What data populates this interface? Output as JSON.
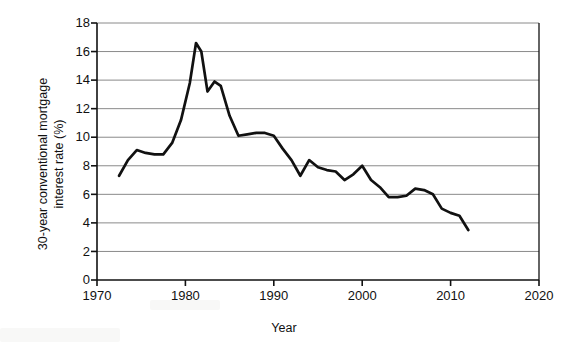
{
  "chart_data": {
    "type": "line",
    "title": "",
    "xlabel": "Year",
    "ylabel": "30-year conventional mortgage interest rate (%)",
    "ylabel_line1": "30-year conventional mortgage",
    "ylabel_line2": "interest rate (%)",
    "xlim": [
      1970,
      2020
    ],
    "ylim": [
      0,
      18
    ],
    "xticks": [
      1970,
      1980,
      1990,
      2000,
      2010,
      2020
    ],
    "xtick_labels": [
      "1970",
      "1980",
      "1990",
      "2000",
      "2010",
      "2020"
    ],
    "yticks": [
      0,
      2,
      4,
      6,
      8,
      10,
      12,
      14,
      16,
      18
    ],
    "ytick_labels": [
      "0",
      "2",
      "4",
      "6",
      "8",
      "10",
      "12",
      "14",
      "16",
      "18"
    ],
    "grid": "horizontal",
    "legend": "none",
    "line_color": "#111111",
    "grid_color": "#8a8a8a",
    "axis_color": "#111111",
    "series": [
      {
        "name": "30-year conventional mortgage interest rate",
        "x": [
          1972.5,
          1973.5,
          1974.5,
          1975.5,
          1976.5,
          1977.5,
          1978.5,
          1979.5,
          1980.5,
          1981.2,
          1981.8,
          1982.5,
          1983.3,
          1984.0,
          1985.0,
          1986.0,
          1987.0,
          1988.0,
          1989.0,
          1990.0,
          1991.0,
          1992.0,
          1993.0,
          1994.0,
          1995.0,
          1996.0,
          1997.0,
          1998.0,
          1999.0,
          2000.0,
          2001.0,
          2002.0,
          2003.0,
          2004.0,
          2005.0,
          2006.0,
          2007.0,
          2008.0,
          2009.0,
          2010.0,
          2011.0,
          2012.0
        ],
        "y": [
          7.3,
          8.4,
          9.1,
          8.9,
          8.8,
          8.8,
          9.6,
          11.2,
          13.8,
          16.6,
          16.0,
          13.2,
          13.9,
          13.6,
          11.5,
          10.1,
          10.2,
          10.3,
          10.3,
          10.1,
          9.2,
          8.4,
          7.3,
          8.4,
          7.9,
          7.7,
          7.6,
          7.0,
          7.4,
          8.0,
          7.0,
          6.5,
          5.8,
          5.8,
          5.9,
          6.4,
          6.3,
          6.0,
          5.0,
          4.7,
          4.5,
          3.5
        ]
      }
    ]
  },
  "axis": {
    "y_tick_0": "0",
    "y_tick_2": "2",
    "y_tick_4": "4",
    "y_tick_6": "6",
    "y_tick_8": "8",
    "y_tick_10": "10",
    "y_tick_12": "12",
    "y_tick_14": "14",
    "y_tick_16": "16",
    "y_tick_18": "18",
    "x_tick_1970": "1970",
    "x_tick_1980": "1980",
    "x_tick_1990": "1990",
    "x_tick_2000": "2000",
    "x_tick_2010": "2010",
    "x_tick_2020": "2020"
  }
}
